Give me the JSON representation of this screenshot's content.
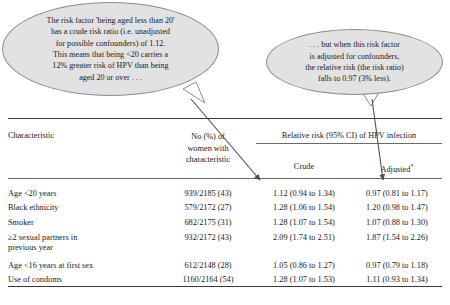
{
  "callouts": {
    "crude": {
      "text": "The risk factor 'being aged less than 20'\nhas a crude risk ratio (i.e. unadjusted\nfor possible confounders) of 1.12.\nThis means that being <20 carries a\n12% greater risk of HPV than being\naged 20 or over . . ."
    },
    "adjusted": {
      "text": ". . . but when this risk factor\nis adjusted for confounders,\nthe relative risk (the risk ratio)\nfalls to 0.97 (3% less)."
    }
  },
  "table": {
    "headers": {
      "characteristic": "Characteristic",
      "number": "No (%) of\nwomen with\ncharacteristic",
      "group_span": "Relative risk (95% CI) of HPV infection",
      "crude": "Crude",
      "adjusted": "Adjusted",
      "adjusted_footnote_marker": "*"
    },
    "rows": [
      {
        "characteristic": "Age <20 years",
        "number": "939/2185 (43)",
        "crude": "1.12 (0.94 to 1.34)",
        "adjusted": "0.97 (0.81 to 1.17)"
      },
      {
        "characteristic": "Black ethnicity",
        "number": "579/2172 (27)",
        "crude": "1.28 (1.06 to 1.54)",
        "adjusted": "1.20 (0.98 to 1.47)"
      },
      {
        "characteristic": "Smoker",
        "number": "682/2175 (31)",
        "crude": "1.28 (1.07 to 1.54)",
        "adjusted": "1.07 (0.88 to 1.30)"
      },
      {
        "characteristic": "≥2 sexual partners in\nprevious year",
        "number": "932/2172 (43)",
        "crude": "2.09 (1.74 to 2.51)",
        "adjusted": "1.87 (1.54 to 2.26)"
      },
      {
        "characteristic": "Age <16 years at first sex",
        "number": "612/2148 (28)",
        "crude": "1.05 (0.86 to 1.27)",
        "adjusted": "0.97 (0.79 to 1.18)"
      },
      {
        "characteristic": "Use of condoms",
        "number": "1160/2164 (54)",
        "crude": "1.28 (1.07 to 1.53)",
        "adjusted": "1.11 (0.93 to 1.34)"
      }
    ]
  },
  "colors": {
    "bubble_fill": "#e2e2e2",
    "bubble_stroke": "#8c8c8c",
    "rule": "#3a3a3a",
    "text": "#1a1a1a"
  }
}
